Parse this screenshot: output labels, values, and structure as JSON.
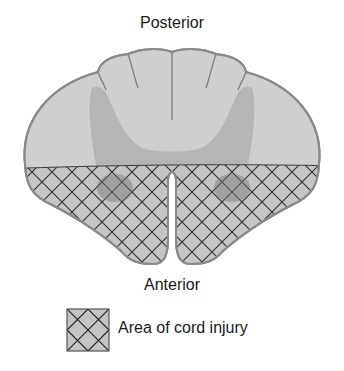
{
  "diagram": {
    "title_top": "Posterior",
    "title_bottom": "Anterior",
    "legend": {
      "label": "Area of cord injury",
      "swatch": "crosshatch"
    },
    "colors": {
      "white_matter": "#cfcfcf",
      "gray_matter": "#b5b5b5",
      "injured_gray_matter": "#8f8f8f",
      "hatch_fill": "#c4c4c4",
      "hatch_lines": "#1e1e1e",
      "outline": "#8a8a8a"
    }
  }
}
